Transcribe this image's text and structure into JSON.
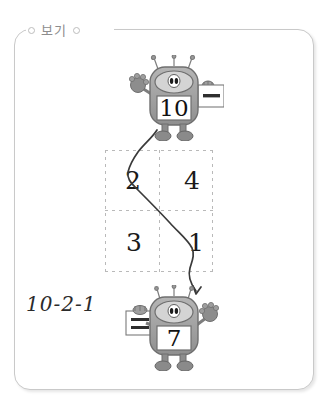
{
  "panel": {
    "legend_label": "보기",
    "border_color": "#c9c9c9",
    "legend_text_color": "#8d8d8d"
  },
  "robots": [
    {
      "id": "robot-top",
      "display_number": "10",
      "card_symbol": "minus",
      "card_symbol_label": "−",
      "raised_arm": "left",
      "body_color": "#9a9a9a"
    },
    {
      "id": "robot-bottom",
      "display_number": "7",
      "card_symbol": "equals",
      "card_symbol_label": "=",
      "raised_arm": "right",
      "body_color": "#9a9a9a"
    }
  ],
  "grid": {
    "rows": 2,
    "cols": 2,
    "border_style": "dashed",
    "border_color": "#b9b9b9",
    "cells": [
      {
        "position": "top-left",
        "value": "2"
      },
      {
        "position": "top-right",
        "value": "4"
      },
      {
        "position": "bottom-left",
        "value": "3"
      },
      {
        "position": "bottom-right",
        "value": "1"
      }
    ]
  },
  "drawn_path": {
    "description": "hand-drawn zigzag line",
    "color": "#333333",
    "from": "robot-top",
    "through": [
      "2",
      "1"
    ],
    "to": "robot-bottom"
  },
  "equation": {
    "text": "10-2-1",
    "color": "#2b2b2b"
  }
}
